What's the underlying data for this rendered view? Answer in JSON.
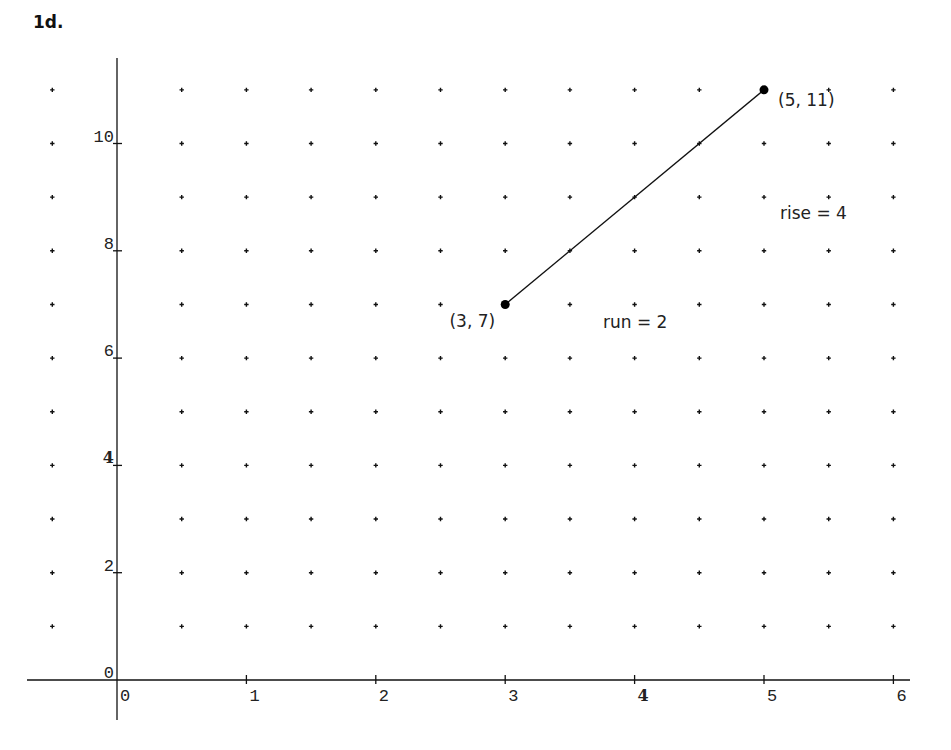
{
  "title": "1d.",
  "chart_data": {
    "type": "scatter",
    "title": "1d.",
    "xlabel": "",
    "ylabel": "",
    "xlim": [
      -0.7,
      6.1
    ],
    "ylim": [
      -1.1,
      11.5
    ],
    "grid": "dot-lattice",
    "grid_dots": {
      "x_start": -0.5,
      "x_end": 6,
      "x_step": 0.5,
      "y_start": 1,
      "y_end": 11,
      "y_step": 1
    },
    "x_ticks": [
      0,
      1,
      2,
      3,
      4,
      5,
      6
    ],
    "x_tick_labels": [
      "0",
      "1",
      "2",
      "3",
      "4",
      "5",
      "6"
    ],
    "y_ticks": [
      0,
      2,
      4,
      6,
      8,
      10
    ],
    "y_tick_labels": [
      "0",
      "2",
      "4",
      "6",
      "8",
      "10"
    ],
    "series": [
      {
        "name": "segment",
        "type": "line",
        "points": [
          {
            "x": 3,
            "y": 7,
            "label": "(3, 7)"
          },
          {
            "x": 5,
            "y": 11,
            "label": "(5, 11)"
          }
        ]
      }
    ],
    "annotations": [
      {
        "text": "rise = 4",
        "x": 5.1,
        "y": 9.2
      },
      {
        "text": "run = 2",
        "x": 3.7,
        "y": 6.7
      }
    ]
  },
  "labels": {
    "point_a": "(3, 7)",
    "point_b": "(5, 11)",
    "rise": "rise = 4",
    "run": "run = 2"
  }
}
